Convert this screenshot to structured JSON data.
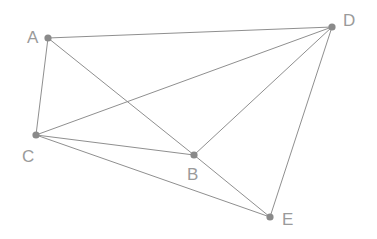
{
  "diagram": {
    "type": "node-link-graph",
    "canvas": {
      "width": 377,
      "height": 239,
      "background": "#ffffff"
    },
    "style": {
      "edge_color": "#8f8f8f",
      "edge_width": 1,
      "node_color": "#8a8a8a",
      "node_radius": 3.6,
      "label_color": "#9a9a9a",
      "label_font_size": 17
    },
    "nodes": [
      {
        "id": "A",
        "label": "A",
        "x": 48,
        "y": 38,
        "label_x": 27,
        "label_y": 29,
        "degree": 3
      },
      {
        "id": "B",
        "label": "B",
        "x": 194,
        "y": 155,
        "label_x": 187,
        "label_y": 166,
        "degree": 4
      },
      {
        "id": "C",
        "label": "C",
        "x": 36,
        "y": 135,
        "label_x": 22,
        "label_y": 148,
        "degree": 4
      },
      {
        "id": "D",
        "label": "D",
        "x": 332,
        "y": 27,
        "label_x": 343,
        "label_y": 12,
        "degree": 4
      },
      {
        "id": "E",
        "label": "E",
        "x": 270,
        "y": 217,
        "label_x": 282,
        "label_y": 211,
        "degree": 3
      }
    ],
    "edges": [
      {
        "id": "A-D",
        "from": "A",
        "to": "D"
      },
      {
        "id": "A-C",
        "from": "A",
        "to": "C"
      },
      {
        "id": "A-B",
        "from": "A",
        "to": "B"
      },
      {
        "id": "C-D",
        "from": "C",
        "to": "D"
      },
      {
        "id": "C-B",
        "from": "C",
        "to": "B"
      },
      {
        "id": "C-E",
        "from": "C",
        "to": "E"
      },
      {
        "id": "B-D",
        "from": "B",
        "to": "D"
      },
      {
        "id": "B-E",
        "from": "B",
        "to": "E"
      },
      {
        "id": "D-E",
        "from": "D",
        "to": "E"
      }
    ],
    "edge_count": 9,
    "node_count": 5
  }
}
